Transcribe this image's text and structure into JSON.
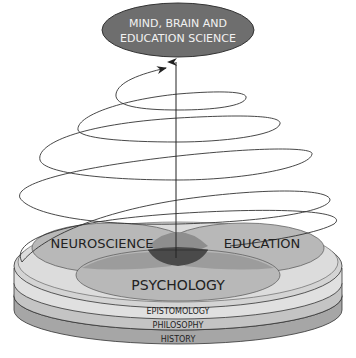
{
  "title": {
    "line1": "MIND, BRAIN AND",
    "line2": "EDUCATION SCIENCE"
  },
  "disciplines": {
    "neuroscience": "NEUROSCIENCE",
    "education": "EDUCATION",
    "psychology": "PSYCHOLOGY"
  },
  "foundation_layers": [
    {
      "label": "EPISTOMOLOGY"
    },
    {
      "label": "PHILOSOPHY"
    },
    {
      "label": "HISTORY"
    }
  ],
  "colors": {
    "title_ellipse": "#6e6e6e",
    "title_text": "#f2f2f2",
    "disk_top": "#d4d4d4",
    "layer_epistomology": "#e0e0e0",
    "layer_philosophy": "#c4c4c4",
    "layer_history": "#a6a6a6",
    "circle_fill": "#b8b8b8",
    "overlap_pair": "#8e8e8e",
    "overlap_center": "#4a4a4a",
    "stroke": "#333333"
  }
}
